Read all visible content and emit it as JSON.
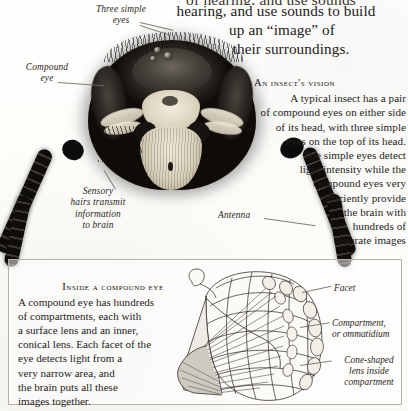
{
  "page": {
    "clipped_top_line": "of hearing, and use sounds",
    "intro": {
      "line1": "hearing, and use sounds to build",
      "line2": "up an “image” of",
      "line3": "their surroundings."
    }
  },
  "photo_labels": [
    {
      "id": "three-simple-eyes",
      "lines": [
        "Three simple",
        "eyes"
      ]
    },
    {
      "id": "compound-eye",
      "lines": [
        "Compound",
        "eye"
      ]
    },
    {
      "id": "sensory-hairs",
      "lines": [
        "Sensory",
        "hairs transmit",
        "information",
        "to brain"
      ]
    },
    {
      "id": "antenna",
      "lines": [
        "Antenna"
      ]
    }
  ],
  "vision": {
    "heading": "An insect's vision",
    "lines": [
      "A typical insect has a pair",
      "of compound eyes on either side",
      "of its head, with three simple",
      "eyes on the top of its head.",
      "The simple eyes detect",
      "light intensity while the",
      "compound eyes very",
      "efficiently provide",
      "the brain with",
      "hundreds of",
      "separate images"
    ]
  },
  "inside": {
    "heading": "Inside a compound eye",
    "lines": [
      "A compound eye has hundreds",
      "of compartments, each with",
      "a surface lens and an inner,",
      "conical lens. Each facet of the",
      "eye detects light from a",
      "very narrow area, and",
      "the brain puts all these",
      "images together."
    ]
  },
  "diagram_labels": [
    {
      "id": "facet",
      "lines": [
        "Facet"
      ]
    },
    {
      "id": "compartment",
      "lines": [
        "Compartment,",
        "or ommatidium"
      ]
    },
    {
      "id": "cone-lens",
      "lines": [
        "Cone-shaped",
        "lens inside",
        "compartment"
      ]
    }
  ],
  "colors": {
    "ink": "#1f1c19",
    "label_ink": "#2b2723",
    "leader": "#6d6862",
    "box_border": "#b6b1a8",
    "paper": "#fdfdfb"
  }
}
